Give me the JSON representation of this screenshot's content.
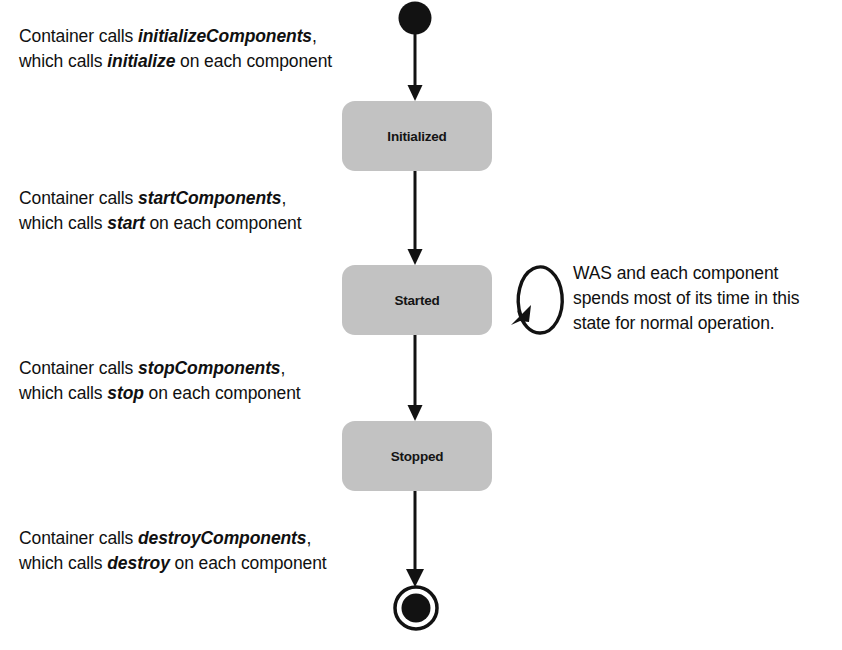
{
  "diagram": {
    "type": "uml-state-machine",
    "colors": {
      "state_fill": "#c2c2c2",
      "stroke": "#121212",
      "background": "#ffffff",
      "text": "#101010"
    },
    "states": [
      {
        "id": "initialized",
        "label": "Initialized"
      },
      {
        "id": "started",
        "label": "Started"
      },
      {
        "id": "stopped",
        "label": "Stopped"
      }
    ],
    "nodes": [
      {
        "id": "start",
        "kind": "initial-state"
      },
      {
        "id": "end",
        "kind": "final-state"
      }
    ],
    "transitions": [
      {
        "id": "t-initialize",
        "from": "start",
        "to": "initialized",
        "label_line1_prefix": "Container calls ",
        "label_line1_em": "initializeComponents",
        "label_line1_suffix": ",",
        "label_line2_prefix": "which calls ",
        "label_line2_em": "initialize",
        "label_line2_suffix": " on each component"
      },
      {
        "id": "t-start",
        "from": "initialized",
        "to": "started",
        "label_line1_prefix": "Container calls ",
        "label_line1_em": "startComponents",
        "label_line1_suffix": ",",
        "label_line2_prefix": "which calls ",
        "label_line2_em": "start",
        "label_line2_suffix": " on each component"
      },
      {
        "id": "t-stop",
        "from": "started",
        "to": "stopped",
        "label_line1_prefix": "Container calls ",
        "label_line1_em": "stopComponents",
        "label_line1_suffix": ",",
        "label_line2_prefix": "which calls ",
        "label_line2_em": "stop",
        "label_line2_suffix": " on each component"
      },
      {
        "id": "t-destroy",
        "from": "stopped",
        "to": "end",
        "label_line1_prefix": "Container calls ",
        "label_line1_em": "destroyComponents",
        "label_line1_suffix": ",",
        "label_line2_prefix": "which calls ",
        "label_line2_em": "destroy",
        "label_line2_suffix": " on each component"
      },
      {
        "id": "t-self-loop",
        "from": "started",
        "to": "started",
        "kind": "self-transition"
      }
    ],
    "note": {
      "target": "started",
      "line1": "WAS and each component",
      "line2": "spends most of its time in this",
      "line3": "state for normal operation."
    }
  }
}
